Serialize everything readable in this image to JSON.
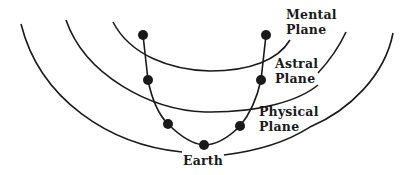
{
  "diagram": {
    "labels": {
      "mental": [
        "Mental",
        "Plane"
      ],
      "astral": [
        "Astral",
        "Plane"
      ],
      "physical": [
        "Physical",
        "Plane"
      ],
      "earth": "Earth"
    },
    "nodes": [
      {
        "x": 143,
        "y": 35
      },
      {
        "x": 148,
        "y": 80
      },
      {
        "x": 168,
        "y": 124
      },
      {
        "x": 204,
        "y": 145
      },
      {
        "x": 240,
        "y": 126
      },
      {
        "x": 261,
        "y": 80
      },
      {
        "x": 266,
        "y": 35
      }
    ],
    "colors": {
      "ink": "#1a1a1a",
      "background": "#ffffff"
    }
  }
}
